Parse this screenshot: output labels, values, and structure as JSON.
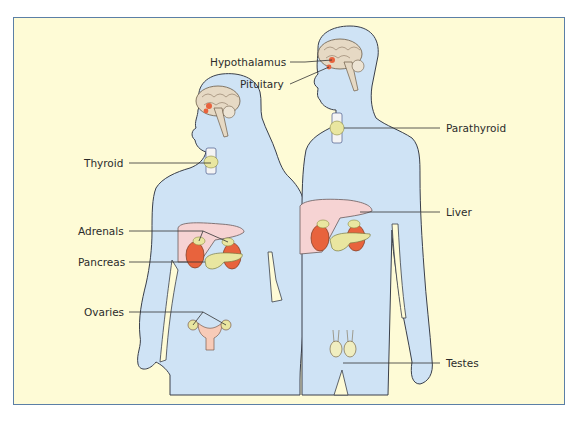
{
  "diagram": {
    "colors": {
      "background": "#fefbd6",
      "frame_border": "#5b7fa6",
      "body_fill": "#cfe3f5",
      "body_outline": "#3a3f4a",
      "brain": "#e6d9c4",
      "gland_red": "#e8633d",
      "liver": "#f6d3d3",
      "gland_yellow": "#e9e6a0",
      "leader_line": "#333333"
    },
    "labels": {
      "hypothalamus": "Hypothalamus",
      "pituitary": "Pituitary",
      "thyroid": "Thyroid",
      "parathyroid": "Parathyroid",
      "adrenals": "Adrenals",
      "liver": "Liver",
      "pancreas": "Pancreas",
      "ovaries": "Ovaries",
      "testes": "Testes"
    },
    "figures": [
      "female",
      "male"
    ]
  }
}
